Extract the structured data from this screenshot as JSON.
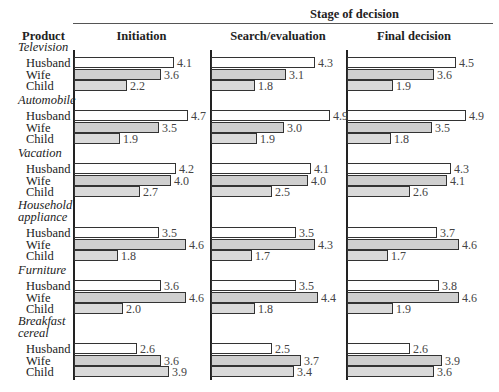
{
  "header": {
    "stage_title": "Stage of decision",
    "product_label": "Product",
    "columns": [
      "Initiation",
      "Search/evaluation",
      "Final decision"
    ]
  },
  "members": [
    "Husband",
    "Wife",
    "Child"
  ],
  "products": [
    {
      "name_lines": [
        "Television"
      ],
      "values": [
        [
          4.1,
          3.6,
          2.2
        ],
        [
          4.3,
          3.1,
          1.8
        ],
        [
          4.5,
          3.6,
          1.9
        ]
      ]
    },
    {
      "name_lines": [
        "Automobile"
      ],
      "values": [
        [
          4.7,
          3.5,
          1.9
        ],
        [
          4.9,
          3.0,
          1.9
        ],
        [
          4.9,
          3.5,
          1.8
        ]
      ]
    },
    {
      "name_lines": [
        "Vacation"
      ],
      "values": [
        [
          4.2,
          4.0,
          2.7
        ],
        [
          4.1,
          4.0,
          2.5
        ],
        [
          4.3,
          4.1,
          2.6
        ]
      ]
    },
    {
      "name_lines": [
        "Household",
        "appliance"
      ],
      "values": [
        [
          3.5,
          4.6,
          1.8
        ],
        [
          3.5,
          4.3,
          1.7
        ],
        [
          3.7,
          4.6,
          1.7
        ]
      ]
    },
    {
      "name_lines": [
        "Furniture"
      ],
      "values": [
        [
          3.6,
          4.6,
          2.0
        ],
        [
          3.5,
          4.4,
          1.8
        ],
        [
          3.8,
          4.6,
          1.9
        ]
      ]
    },
    {
      "name_lines": [
        "Breakfast",
        "cereal"
      ],
      "values": [
        [
          2.6,
          3.6,
          3.9
        ],
        [
          2.5,
          3.7,
          3.4
        ],
        [
          2.6,
          3.9,
          3.6
        ]
      ]
    }
  ],
  "colors": {
    "husband": "#ffffff",
    "wife": "#cfcfcf",
    "child": "#dadada",
    "border": "#333333"
  },
  "chart_data": {
    "type": "bar",
    "orientation": "horizontal",
    "title": "Stage of decision",
    "ylabel": "Product",
    "panels": [
      "Initiation",
      "Search/evaluation",
      "Final decision"
    ],
    "categories": [
      "Television",
      "Automobile",
      "Vacation",
      "Household appliance",
      "Furniture",
      "Breakfast cereal"
    ],
    "series": [
      {
        "name": "Husband",
        "panel_values": {
          "Initiation": [
            4.1,
            4.7,
            4.2,
            3.5,
            3.6,
            2.6
          ],
          "Search/evaluation": [
            4.3,
            4.9,
            4.1,
            3.5,
            3.5,
            2.5
          ],
          "Final decision": [
            4.5,
            4.9,
            4.3,
            3.7,
            3.8,
            2.6
          ]
        }
      },
      {
        "name": "Wife",
        "panel_values": {
          "Initiation": [
            3.6,
            3.5,
            4.0,
            4.6,
            4.6,
            3.6
          ],
          "Search/evaluation": [
            3.1,
            3.0,
            4.0,
            4.3,
            4.4,
            3.7
          ],
          "Final decision": [
            3.6,
            3.5,
            4.1,
            4.6,
            4.6,
            3.9
          ]
        }
      },
      {
        "name": "Child",
        "panel_values": {
          "Initiation": [
            2.2,
            1.9,
            2.7,
            1.8,
            2.0,
            3.9
          ],
          "Search/evaluation": [
            1.8,
            1.9,
            2.5,
            1.7,
            1.8,
            3.4
          ],
          "Final decision": [
            1.9,
            1.8,
            2.6,
            1.7,
            1.9,
            3.6
          ]
        }
      }
    ],
    "grid": false,
    "legend": "none (member labels at left)"
  }
}
